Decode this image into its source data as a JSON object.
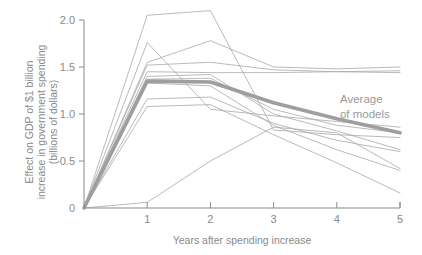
{
  "chart_data": {
    "type": "line",
    "title": "",
    "xlabel": "Years after spending increase",
    "ylabel": "Effect on GDP of $1 billion increase in government spending (billions of dollars)",
    "ylabel_line1": "Effect on GDP of $1 billion",
    "ylabel_line2": "increase in government spending",
    "ylabel_line3": "(billions of dollars)",
    "x": [
      0,
      1,
      2,
      3,
      4,
      5
    ],
    "xlim": [
      0,
      5
    ],
    "ylim": [
      0,
      2.1
    ],
    "xticks": [
      0,
      1,
      2,
      3,
      4,
      5
    ],
    "xtick_labels": [
      "",
      "1",
      "2",
      "3",
      "4",
      "5"
    ],
    "yticks": [
      0,
      0.5,
      1.0,
      1.5,
      2.0
    ],
    "ytick_labels": [
      "0",
      "0.5",
      "1.0",
      "1.5",
      "2.0"
    ],
    "grid": false,
    "legend": "none",
    "annotations": [
      {
        "text_line1": "Average",
        "text_line2": "of models",
        "x": 4.05,
        "y": 1.12,
        "color": "#9a9a9a"
      }
    ],
    "series": [
      {
        "name": "model-1",
        "values": [
          0,
          2.05,
          2.1,
          0.83,
          0.78,
          0.75
        ],
        "style": "thin",
        "color": "#a9a9a9"
      },
      {
        "name": "model-2",
        "values": [
          0,
          1.76,
          1.05,
          0.98,
          0.92,
          0.86
        ],
        "style": "thin",
        "color": "#a9a9a9"
      },
      {
        "name": "model-3",
        "values": [
          0,
          1.55,
          1.78,
          1.5,
          1.48,
          1.5
        ],
        "style": "thin",
        "color": "#a9a9a9"
      },
      {
        "name": "model-4",
        "values": [
          0,
          1.52,
          1.55,
          1.47,
          1.45,
          1.44
        ],
        "style": "thin",
        "color": "#a9a9a9"
      },
      {
        "name": "model-5",
        "values": [
          0,
          1.45,
          1.44,
          1.44,
          1.45,
          1.46
        ],
        "style": "thin",
        "color": "#a9a9a9"
      },
      {
        "name": "model-6",
        "values": [
          0,
          1.4,
          1.42,
          1.0,
          0.82,
          0.62
        ],
        "style": "thin",
        "color": "#a9a9a9"
      },
      {
        "name": "model-7",
        "values": [
          0,
          1.37,
          1.38,
          1.05,
          0.88,
          0.8
        ],
        "style": "thin",
        "color": "#a9a9a9"
      },
      {
        "name": "model-8",
        "values": [
          0,
          1.33,
          1.3,
          0.88,
          0.62,
          0.4
        ],
        "style": "thin",
        "color": "#a9a9a9"
      },
      {
        "name": "model-9",
        "values": [
          0,
          1.16,
          1.18,
          0.9,
          0.72,
          0.6
        ],
        "style": "thin",
        "color": "#a9a9a9"
      },
      {
        "name": "model-10",
        "values": [
          0,
          1.08,
          1.1,
          0.78,
          0.48,
          0.16
        ],
        "style": "thin",
        "color": "#a9a9a9"
      },
      {
        "name": "model-11",
        "values": [
          0,
          0.06,
          0.5,
          0.86,
          0.8,
          0.42
        ],
        "style": "thin",
        "color": "#a9a9a9"
      },
      {
        "name": "Average of models",
        "values": [
          0,
          1.35,
          1.34,
          1.12,
          0.95,
          0.8
        ],
        "style": "bold",
        "color": "#9e9e9e"
      }
    ]
  }
}
